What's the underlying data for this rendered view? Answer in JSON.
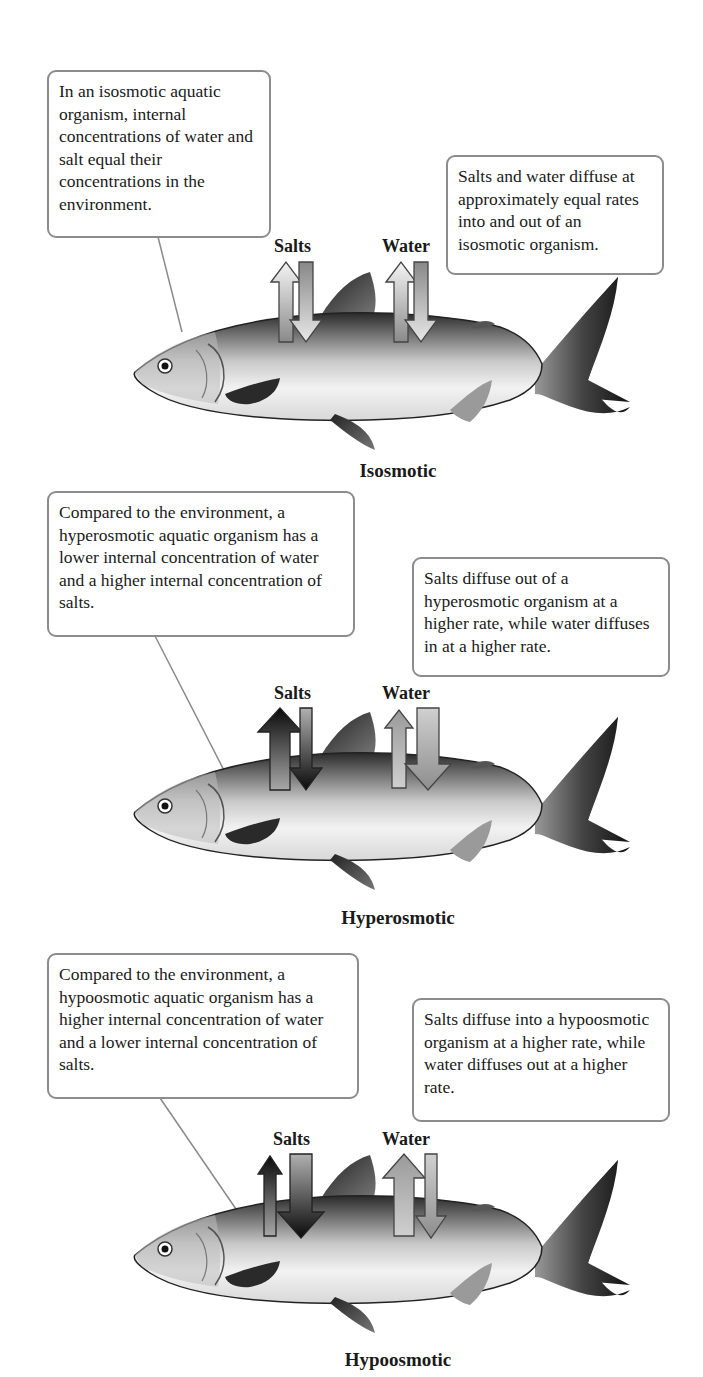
{
  "panels": [
    {
      "name": "Isosmotic",
      "left_text": "In an isosmotic aquatic organism, internal concentrations of water and salt equal their concentrations in the environment.",
      "right_text": "Salts and water diffuse at approximately equal rates into and out of an isosmotic organism.",
      "salts_label": "Salts",
      "water_label": "Water",
      "salts_in_rate": "equal",
      "salts_out_rate": "equal",
      "water_in_rate": "equal",
      "water_out_rate": "equal"
    },
    {
      "name": "Hyperosmotic",
      "left_text": "Compared to the environment, a hyperosmotic aquatic organism has a lower internal concentration of water and a higher internal concentration of salts.",
      "right_text": "Salts diffuse out of a hyperosmotic organism at a higher rate, while water diffuses in at a higher rate.",
      "salts_label": "Salts",
      "water_label": "Water",
      "salts_in_rate": "low",
      "salts_out_rate": "high",
      "water_in_rate": "high",
      "water_out_rate": "low"
    },
    {
      "name": "Hypoosmotic",
      "left_text": "Compared to the environment, a hypoosmotic aquatic organism has a higher internal concentration of water and a lower internal concentration of salts.",
      "right_text": "Salts diffuse into a hypoosmotic organism at a higher rate, while water diffuses out at a higher rate.",
      "salts_label": "Salts",
      "water_label": "Water",
      "salts_in_rate": "high",
      "salts_out_rate": "low",
      "water_in_rate": "low",
      "water_out_rate": "high"
    }
  ],
  "colors": {
    "box_border": "#8c8c8c",
    "leader_line": "#8a8a8a",
    "arrow_dark": "#111111",
    "arrow_light": "#c8c8c8"
  }
}
